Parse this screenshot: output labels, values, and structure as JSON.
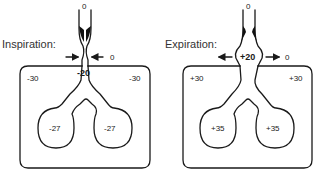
{
  "panels": [
    {
      "title": "Inspiration:",
      "mouth_pressure": "0",
      "airway_outside_pressure": "0",
      "airway_pressure": "-20",
      "pleural_left": "-30",
      "pleural_right": "-30",
      "alveolar_left": "-27",
      "alveolar_right": "-27",
      "arrow_direction": "inward"
    },
    {
      "title": "Expiration:",
      "mouth_pressure": "0",
      "airway_outside_pressure": "0",
      "airway_pressure": "+20",
      "pleural_left": "+30",
      "pleural_right": "+30",
      "alveolar_left": "+35",
      "alveolar_right": "+35",
      "arrow_direction": "outward"
    }
  ],
  "colors": {
    "stroke": "#1a1a1a",
    "background": "#ffffff"
  }
}
